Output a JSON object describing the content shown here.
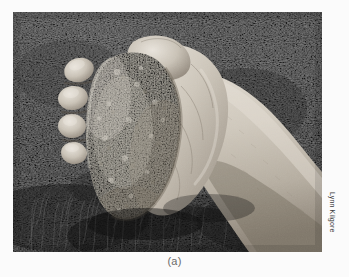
{
  "figure": {
    "caption": "(a)",
    "credit": "Lynn Kilgore",
    "alt_description": "A human hand squeezing a clump of moist soil into a ball, held over grassy ground",
    "photo": {
      "subject": "hand squeezing soil clump",
      "background": "dark grass and vegetation",
      "is_grayscale": true,
      "frame": {
        "x": 13,
        "y": 12,
        "width": 309,
        "height": 240
      }
    }
  },
  "colors": {
    "page_background": "#fbfbfb",
    "caption_text": "#6a6a6a",
    "credit_text": "#3a3a3a",
    "grass_dark": "#262626",
    "grass_mid": "#4a4a4a",
    "grass_light": "#6e6e6e",
    "skin_light": "#d8d2c8",
    "skin_mid": "#bdb5a9",
    "skin_shadow": "#8e8579",
    "soil_light": "#d6d2c6",
    "soil_mid": "#b8b3a5",
    "soil_dark": "#8d8878"
  }
}
